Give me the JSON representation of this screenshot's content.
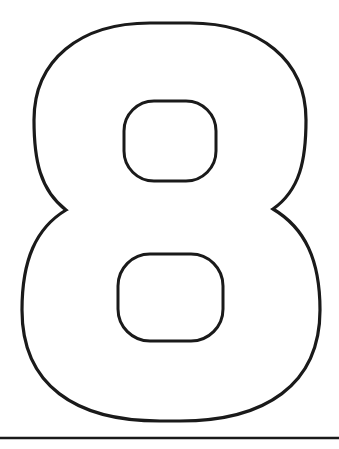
{
  "figure": {
    "glyph": "8",
    "stroke_color": "#1a1a1a",
    "fill_color": "#ffffff",
    "background": "#ffffff"
  },
  "baseline": {
    "color": "#1a1a1a"
  }
}
